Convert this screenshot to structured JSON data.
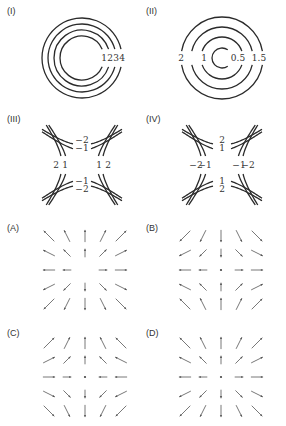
{
  "figure": {
    "panels": [
      {
        "id": "I",
        "label": "(I)",
        "type": "contour-circles",
        "center": [
          82,
          58
        ],
        "radii": [
          22,
          28,
          34,
          40
        ],
        "levels": [
          "1",
          "2",
          "3",
          "4"
        ]
      },
      {
        "id": "II",
        "label": "(II)",
        "type": "contour-circles",
        "center": [
          222,
          58
        ],
        "radii": [
          10,
          21,
          31,
          41
        ],
        "levels": [
          "0.5",
          "1",
          "1.5",
          "2"
        ],
        "label_positions": [
          {
            "text": "2",
            "x": 181,
            "y": 61
          },
          {
            "text": "1",
            "x": 204,
            "y": 61
          },
          {
            "text": "0.5",
            "x": 238,
            "y": 61
          },
          {
            "text": "1.5",
            "x": 259,
            "y": 61
          }
        ]
      },
      {
        "id": "III",
        "label": "(III)",
        "type": "contour-hyperbolas",
        "center": [
          82,
          165
        ],
        "labels": {
          "top": [
            "-2",
            "-1"
          ],
          "bottom": [
            "-1",
            "-2"
          ],
          "left": [
            "2",
            "1"
          ],
          "right": [
            "1",
            "2"
          ]
        }
      },
      {
        "id": "IV",
        "label": "(IV)",
        "type": "contour-hyperbolas",
        "center": [
          222,
          165
        ],
        "labels": {
          "top": [
            "2",
            "1"
          ],
          "bottom": [
            "1",
            "2"
          ],
          "left": [
            "-2",
            "-1"
          ],
          "right": [
            "-1",
            "-2"
          ]
        }
      },
      {
        "id": "A",
        "label": "(A)",
        "type": "vector-field",
        "center": [
          85,
          270
        ],
        "field": "radial-out",
        "center_dot": false
      },
      {
        "id": "B",
        "label": "(B)",
        "type": "vector-field",
        "center": [
          221,
          270
        ],
        "field": "x,-y",
        "center_dot": true
      },
      {
        "id": "C",
        "label": "(C)",
        "type": "vector-field",
        "center": [
          85,
          377
        ],
        "field": "-x,y",
        "center_dot": true
      },
      {
        "id": "D",
        "label": "(D)",
        "type": "vector-field",
        "center": [
          221,
          377
        ],
        "field": "radial-out",
        "center_dot": true
      }
    ],
    "colors": {
      "curve": "#2a2a2a",
      "vector": "#555555",
      "text": "#333333",
      "background": "#ffffff"
    }
  }
}
